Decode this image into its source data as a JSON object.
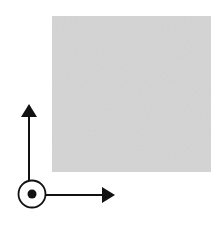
{
  "diagram": {
    "background": "#ffffff",
    "region": {
      "label": "gray-square-region",
      "x": 52,
      "y": 16,
      "width": 159,
      "height": 156,
      "fill": "#cfcfcf",
      "texture": "grainy"
    },
    "axes": {
      "color": "#111111",
      "origin": {
        "x": 32,
        "y": 194,
        "symbol": "out-of-page (dot in circle)",
        "circle_radius": 14,
        "dot_radius": 4.5
      },
      "vertical_arrow": {
        "from_y": 180,
        "to_y": 105,
        "x": 29,
        "direction": "up"
      },
      "horizontal_arrow": {
        "from_x": 46,
        "to_x": 114,
        "y": 195,
        "direction": "right"
      }
    }
  }
}
